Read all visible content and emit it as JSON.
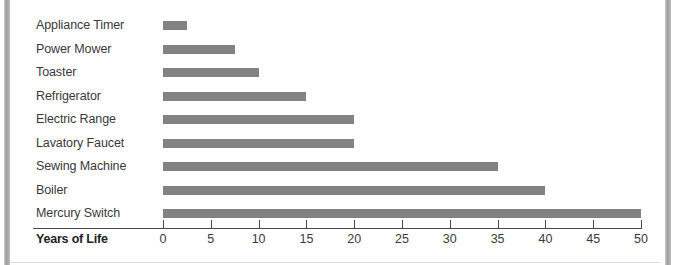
{
  "chart_data": {
    "type": "bar",
    "orientation": "horizontal",
    "title": "",
    "xlabel": "Years of Life",
    "ylabel": "",
    "xlim": [
      0,
      50
    ],
    "grid": false,
    "legend": null,
    "bar_color": "#828282",
    "categories": [
      "Appliance Timer",
      "Power Mower",
      "Toaster",
      "Refrigerator",
      "Electric Range",
      "Lavatory Faucet",
      "Sewing Machine",
      "Boiler",
      "Mercury Switch"
    ],
    "values": [
      2.5,
      7.5,
      10,
      15,
      20,
      20,
      35,
      40,
      50
    ],
    "xticks": [
      0,
      5,
      10,
      15,
      20,
      25,
      30,
      35,
      40,
      45,
      50
    ],
    "xtick_labels": [
      "0",
      "5",
      "10",
      "15",
      "20",
      "25",
      "30",
      "35",
      "40",
      "45",
      "50"
    ]
  },
  "page": {
    "background_color": "#ffffff",
    "gutter_color": "#9d9d9d"
  }
}
